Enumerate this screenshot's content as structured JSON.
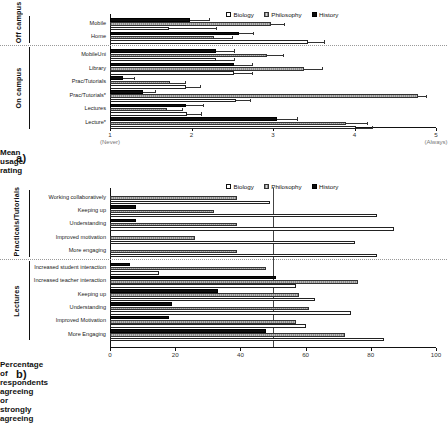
{
  "figure": {
    "panel_a_letter": "a)",
    "panel_b_letter": "b)"
  },
  "legend": {
    "items": [
      {
        "label": "Biology",
        "key": "biology",
        "color": "#ffffff"
      },
      {
        "label": "Philosophy",
        "key": "philosophy",
        "color": "#a8a8a8"
      },
      {
        "label": "History",
        "key": "history",
        "color": "#0d0d0d"
      }
    ]
  },
  "chart_data": [
    {
      "id": "panel-a",
      "type": "bar",
      "orientation": "horizontal",
      "title": "",
      "xlabel": "Mean usage rating",
      "ylabel": "",
      "xlim": [
        1,
        5
      ],
      "xticks": [
        1,
        2,
        3,
        4,
        5
      ],
      "xticklabels": [
        "1",
        "2",
        "3",
        "4",
        "5"
      ],
      "xtick_annotations": {
        "1": "(Never)",
        "5": "(Always)"
      },
      "grid": false,
      "legend_position": "top-right",
      "groups": [
        {
          "name": "Off campus",
          "categories": [
            "Mobile",
            "Home"
          ]
        },
        {
          "name": "On campus",
          "categories": [
            "MobileUni",
            "Library",
            "Prac/Tutorials",
            "Prac/Tutorials*",
            "Lectures",
            "Lecture*"
          ]
        }
      ],
      "categories": [
        "Mobile",
        "Home",
        "MobileUni",
        "Library",
        "Prac/Tutorials",
        "Prac/Tutorials*",
        "Lectures",
        "Lecture*"
      ],
      "series": [
        {
          "name": "History",
          "key": "history",
          "values": [
            1.98,
            2.58,
            2.3,
            2.52,
            1.16,
            1.4,
            1.93,
            3.05
          ],
          "err_low": [
            1.98,
            2.58,
            2.3,
            2.52,
            1.16,
            1.4,
            1.93,
            3.05
          ],
          "err_high": [
            2.22,
            2.76,
            2.52,
            2.74,
            1.3,
            1.55,
            2.14,
            3.3
          ]
        },
        {
          "name": "Philosophy",
          "key": "philosophy",
          "values": [
            2.97,
            2.28,
            2.93,
            3.38,
            1.74,
            4.78,
            1.7,
            3.9
          ],
          "err_low": [
            2.97,
            2.28,
            2.93,
            3.38,
            1.74,
            4.78,
            1.7,
            3.9
          ],
          "err_high": [
            3.14,
            2.5,
            3.12,
            3.6,
            1.92,
            4.88,
            1.88,
            4.15
          ]
        },
        {
          "name": "Biology",
          "key": "biology",
          "values": [
            1.72,
            3.43,
            2.3,
            2.52,
            1.93,
            2.55,
            1.95,
            4.02
          ],
          "err_low": [
            1.72,
            3.43,
            2.3,
            2.52,
            1.93,
            2.55,
            1.95,
            4.02
          ],
          "err_high": [
            2.3,
            3.62,
            2.52,
            2.74,
            2.1,
            2.72,
            2.12,
            4.22
          ]
        }
      ]
    },
    {
      "id": "panel-b",
      "type": "bar",
      "orientation": "horizontal",
      "title": "",
      "xlabel": "Percentage of respondents agreeing or strongly agreeing",
      "ylabel": "",
      "xlim": [
        0,
        100
      ],
      "xticks": [
        0,
        20,
        40,
        60,
        80,
        100
      ],
      "xticklabels": [
        "0",
        "20",
        "40",
        "60",
        "80",
        "100"
      ],
      "reference_line": 50,
      "grid": false,
      "legend_position": "top-right",
      "groups": [
        {
          "name": "Practicals/Tutorials",
          "categories": [
            "Working collaboratively",
            "Keeping up",
            "Understanding",
            "Improved motivation",
            "More engaging"
          ]
        },
        {
          "name": "Lectures",
          "categories": [
            "Increased student interaction",
            "Increased teacher interaction",
            "Keeping up",
            "Understanding",
            "Improved Motivation",
            "More Engaging"
          ]
        }
      ],
      "categories": [
        "Working collaboratively",
        "Keeping up",
        "Understanding",
        "Improved motivation",
        "More engaging",
        "Increased student interaction",
        "Increased teacher interaction",
        "Keeping up",
        "Understanding",
        "Improved Motivation",
        "More Engaging"
      ],
      "series": [
        {
          "name": "History",
          "key": "history",
          "values": [
            0,
            8,
            8,
            0,
            0,
            6,
            51,
            33,
            19,
            18,
            48
          ]
        },
        {
          "name": "Philosophy",
          "key": "philosophy",
          "values": [
            39,
            32,
            39,
            26,
            39,
            48,
            76,
            58,
            61,
            57,
            72
          ]
        },
        {
          "name": "Biology",
          "key": "biology",
          "values": [
            49,
            82,
            87,
            75,
            82,
            15,
            57,
            63,
            74,
            60,
            84
          ]
        }
      ]
    }
  ]
}
